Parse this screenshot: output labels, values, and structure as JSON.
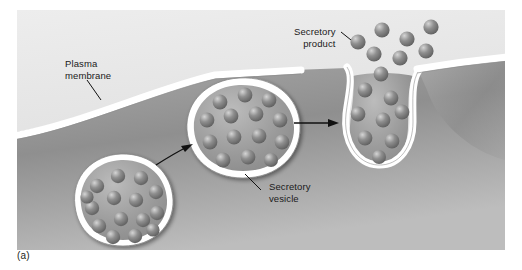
{
  "figure": {
    "caption": "(a)",
    "type": "biology-diagram",
    "panel_background": "#e3e3e3",
    "colors": {
      "extracellular": "#e6e6e6",
      "cytoplasm_light": "#b9b9b9",
      "cytoplasm_dark": "#7e7e7e",
      "membrane": "#ffffff",
      "membrane_shadow": "#6f6f6f",
      "granule": "#8a8a8a",
      "granule_highlight": "#d8d8d8",
      "granule_shadow": "#5a5a5a",
      "text": "#1a1a1a",
      "arrow": "#111111"
    }
  },
  "labels": {
    "plasma_membrane": "Plasma\nmembrane",
    "secretory_product": "Secretory\nproduct",
    "secretory_vesicle": "Secretory\nvesicle"
  },
  "structures": {
    "vesicle_free": {
      "name": "free secretory vesicle",
      "stage": "1",
      "granule_count": 15
    },
    "vesicle_docked": {
      "name": "docked secretory vesicle",
      "stage": "2",
      "granule_count": 14
    },
    "vesicle_fused": {
      "name": "fused secretory vesicle releasing contents",
      "stage": "3",
      "granule_count": 9
    },
    "released_product": {
      "name": "released secretory product granules",
      "granule_count": 7
    }
  },
  "arrows": [
    {
      "name": "arrow-free-to-docked",
      "style": "curved"
    },
    {
      "name": "arrow-docked-to-fused",
      "style": "straight"
    }
  ]
}
